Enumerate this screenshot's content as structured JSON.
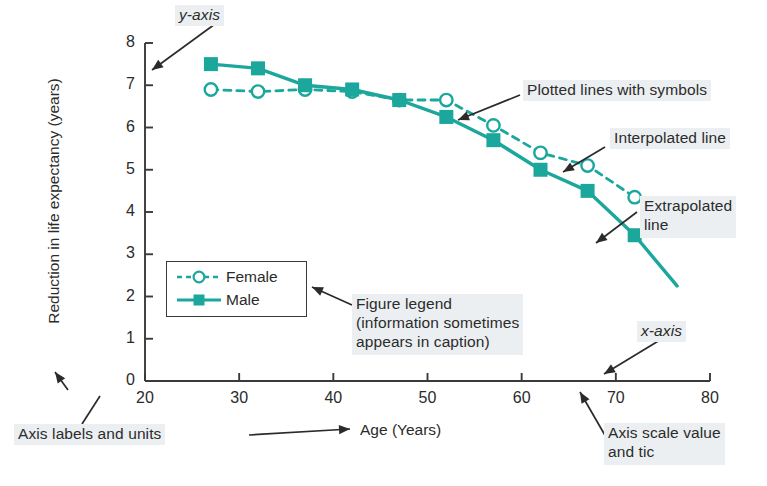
{
  "figure": {
    "axis_color": "#3a3a3a",
    "series_color": "#1ba79c",
    "annotation_bg": "#eceff1"
  },
  "axes": {
    "x_title": "Age (Years)",
    "y_title": "Reduction in life expectancy (years)",
    "x_ticks": [
      "20",
      "30",
      "40",
      "50",
      "60",
      "70",
      "80"
    ],
    "y_ticks": [
      "0",
      "1",
      "2",
      "3",
      "4",
      "5",
      "6",
      "7",
      "8"
    ]
  },
  "legend": {
    "female_label": "Female",
    "male_label": "Male"
  },
  "annotations": {
    "y_axis": "y-axis",
    "x_axis": "x-axis",
    "plotted_lines": "Plotted lines with symbols",
    "interpolated": "Interpolated line",
    "extrapolated_l1": "Extrapolated",
    "extrapolated_l2": "line",
    "figure_legend_l1": "Figure legend",
    "figure_legend_l2": "(information sometimes",
    "figure_legend_l3": "appears in caption)",
    "axis_labels_units": "Axis labels and units",
    "axis_scale_l1": "Axis scale value",
    "axis_scale_l2": "and tic"
  },
  "chart_data": {
    "type": "line",
    "title": "",
    "xlabel": "Age (Years)",
    "ylabel": "Reduction in life expectancy (years)",
    "xlim": [
      20,
      80
    ],
    "ylim": [
      0,
      8
    ],
    "xticks": [
      20,
      30,
      40,
      50,
      60,
      70,
      80
    ],
    "yticks": [
      0,
      1,
      2,
      3,
      4,
      5,
      6,
      7,
      8
    ],
    "grid": false,
    "legend_position": "inside-lower-left",
    "series": [
      {
        "name": "Female",
        "marker": "open-circle",
        "linestyle": "dashed",
        "color": "#1ba79c",
        "x": [
          27,
          32,
          37,
          42,
          47,
          52,
          57,
          62,
          67,
          72
        ],
        "values": [
          6.9,
          6.85,
          6.9,
          6.85,
          6.65,
          6.65,
          6.05,
          5.4,
          5.1,
          4.35
        ]
      },
      {
        "name": "Male",
        "marker": "filled-square",
        "linestyle": "solid",
        "color": "#1ba79c",
        "x": [
          27,
          32,
          37,
          42,
          47,
          52,
          57,
          62,
          67,
          72
        ],
        "values": [
          7.5,
          7.4,
          7.0,
          6.9,
          6.65,
          6.25,
          5.7,
          5.0,
          4.5,
          3.45
        ],
        "extrapolated_to": {
          "x": 76.5,
          "y": 2.25
        }
      }
    ]
  }
}
